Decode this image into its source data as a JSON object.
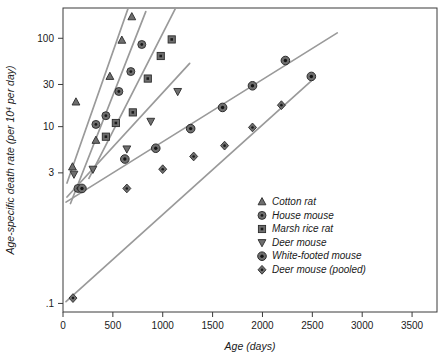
{
  "chart_data": {
    "type": "scatter",
    "title": "",
    "xlabel": "Age (days)",
    "ylabel": "Age-specific death rate (per 10⁴ per day)",
    "ylabel_parts": {
      "main": "Age-specific death rate (per 10",
      "sup": "4",
      "tail": " per day)"
    },
    "yscale": "log",
    "xscale": "linear",
    "xlim": [
      0,
      3750
    ],
    "ylim": [
      0.08,
      220
    ],
    "grid": false,
    "legend_position": "lower-right inside plot",
    "x_ticks": [
      0,
      500,
      1000,
      1500,
      2000,
      2500,
      3000,
      3500
    ],
    "x_tick_labels": [
      "0",
      "500",
      "1000",
      "1500",
      "2000",
      "2500",
      "3000",
      "3500"
    ],
    "y_ticks": [
      100,
      30,
      10,
      3,
      0.1
    ],
    "y_tick_labels": [
      "100",
      "30",
      "10",
      "3",
      ".1"
    ],
    "series": [
      {
        "name": "Cotton rat",
        "marker": "triangle-up",
        "color": "#6e6e6e",
        "points": [
          {
            "x": 95,
            "y": 3.5
          },
          {
            "x": 130,
            "y": 19.0
          },
          {
            "x": 330,
            "y": 7.0
          },
          {
            "x": 470,
            "y": 37.0
          },
          {
            "x": 590,
            "y": 95.0
          },
          {
            "x": 690,
            "y": 175.0
          }
        ],
        "fit": {
          "x0": 40,
          "y0": 2.3,
          "x1": 660,
          "y1": 230
        }
      },
      {
        "name": "House mouse",
        "marker": "circle-dot",
        "color": "#6e6e6e",
        "points": [
          {
            "x": 150,
            "y": 2.0
          },
          {
            "x": 330,
            "y": 10.6
          },
          {
            "x": 430,
            "y": 13.3
          },
          {
            "x": 560,
            "y": 25.0
          },
          {
            "x": 680,
            "y": 42.0
          },
          {
            "x": 790,
            "y": 85.0
          }
        ],
        "fit": {
          "x0": 75,
          "y0": 1.35,
          "x1": 830,
          "y1": 200
        }
      },
      {
        "name": "Marsh rice rat",
        "marker": "square-dot",
        "color": "#6e6e6e",
        "points": [
          {
            "x": 430,
            "y": 7.7
          },
          {
            "x": 530,
            "y": 11.0
          },
          {
            "x": 700,
            "y": 14.5
          },
          {
            "x": 850,
            "y": 35.0
          },
          {
            "x": 980,
            "y": 63.0
          },
          {
            "x": 1090,
            "y": 97.0
          }
        ],
        "fit": {
          "x0": 260,
          "y0": 2.6,
          "x1": 1125,
          "y1": 215
        }
      },
      {
        "name": "Deer mouse",
        "marker": "triangle-down",
        "color": "#6e6e6e",
        "points": [
          {
            "x": 110,
            "y": 2.9
          },
          {
            "x": 300,
            "y": 3.3
          },
          {
            "x": 640,
            "y": 5.6
          },
          {
            "x": 880,
            "y": 11.5
          },
          {
            "x": 1150,
            "y": 25.0
          }
        ],
        "fit": {
          "x0": 40,
          "y0": 1.6,
          "x1": 1270,
          "y1": 52
        }
      },
      {
        "name": "White-footed mouse",
        "marker": "circle-target",
        "color": "#6e6e6e",
        "points": [
          {
            "x": 190,
            "y": 2.0
          },
          {
            "x": 620,
            "y": 4.3
          },
          {
            "x": 930,
            "y": 5.7
          },
          {
            "x": 1280,
            "y": 9.5
          },
          {
            "x": 1600,
            "y": 16.5
          },
          {
            "x": 1900,
            "y": 29.0
          },
          {
            "x": 2230,
            "y": 56.0
          },
          {
            "x": 2490,
            "y": 37.0
          }
        ],
        "fit": {
          "x0": 30,
          "y0": 1.4,
          "x1": 2750,
          "y1": 115
        }
      },
      {
        "name": "Deer mouse (pooled)",
        "marker": "diamond-dot",
        "color": "#6e6e6e",
        "points": [
          {
            "x": 100,
            "y": 0.115
          },
          {
            "x": 640,
            "y": 2.0
          },
          {
            "x": 1000,
            "y": 3.3
          },
          {
            "x": 1310,
            "y": 4.6
          },
          {
            "x": 1620,
            "y": 6.1
          },
          {
            "x": 1900,
            "y": 9.8
          },
          {
            "x": 2190,
            "y": 17.5
          }
        ],
        "fit": {
          "x0": 30,
          "y0": 0.105,
          "x1": 2490,
          "y1": 33
        }
      }
    ]
  },
  "legend": {
    "items": [
      {
        "label": "Cotton rat",
        "marker": "triangle-up"
      },
      {
        "label": "House mouse",
        "marker": "circle-dot"
      },
      {
        "label": "Marsh rice rat",
        "marker": "square-dot"
      },
      {
        "label": "Deer mouse",
        "marker": "triangle-down"
      },
      {
        "label": "White-footed mouse",
        "marker": "circle-target"
      },
      {
        "label": "Deer mouse (pooled)",
        "marker": "diamond-dot"
      }
    ]
  },
  "colors": {
    "line": "#9a9a9a",
    "marker_fill": "#6e6e6e",
    "marker_stroke": "#2b2b2b",
    "axis": "#3a3a3a",
    "text": "#1a1a1a",
    "background": "#ffffff"
  }
}
